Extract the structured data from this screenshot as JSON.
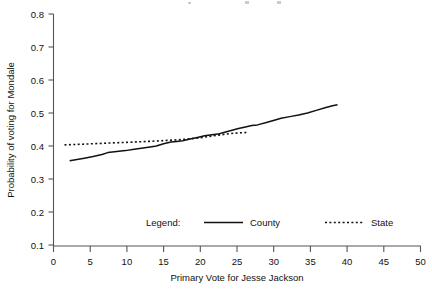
{
  "chart_data": {
    "type": "line",
    "title": "",
    "subtitle": "",
    "xlabel": "Primary Vote for Jesse Jackson",
    "ylabel": "Probability of voting for Mondale",
    "xlim": [
      0,
      50
    ],
    "ylim": [
      0.1,
      0.8
    ],
    "xticks": [
      0,
      5,
      10,
      15,
      20,
      25,
      30,
      35,
      40,
      45,
      50
    ],
    "xtick_labels": [
      "0",
      "5",
      "10",
      "15",
      "20",
      "25",
      "30",
      "35",
      "40",
      "45",
      "50"
    ],
    "yticks": [
      0.1,
      0.2,
      0.3,
      0.4,
      0.5,
      0.6,
      0.7,
      0.8
    ],
    "ytick_labels": [
      "0.1",
      "0.2",
      "0.3",
      "0.4",
      "0.5",
      "0.6",
      "0.7",
      "0.8"
    ],
    "grid": false,
    "legend_position": "inside-bottom-center",
    "legend_title": "Legend:",
    "series": [
      {
        "name": "County",
        "style": "solid",
        "color": "#111111",
        "points": [
          [
            2.2,
            0.355
          ],
          [
            3.0,
            0.358
          ],
          [
            4.2,
            0.363
          ],
          [
            5.4,
            0.368
          ],
          [
            6.6,
            0.374
          ],
          [
            7.4,
            0.38
          ],
          [
            8.6,
            0.383
          ],
          [
            9.8,
            0.386
          ],
          [
            11.0,
            0.39
          ],
          [
            12.2,
            0.394
          ],
          [
            13.4,
            0.398
          ],
          [
            14.0,
            0.4
          ],
          [
            15.0,
            0.407
          ],
          [
            16.0,
            0.412
          ],
          [
            16.8,
            0.414
          ],
          [
            17.6,
            0.416
          ],
          [
            18.6,
            0.421
          ],
          [
            19.6,
            0.426
          ],
          [
            20.6,
            0.431
          ],
          [
            21.6,
            0.434
          ],
          [
            22.4,
            0.436
          ],
          [
            23.2,
            0.441
          ],
          [
            24.2,
            0.447
          ],
          [
            25.2,
            0.453
          ],
          [
            26.0,
            0.457
          ],
          [
            27.0,
            0.462
          ],
          [
            27.8,
            0.464
          ],
          [
            29.0,
            0.471
          ],
          [
            30.2,
            0.479
          ],
          [
            31.0,
            0.484
          ],
          [
            32.2,
            0.489
          ],
          [
            33.4,
            0.494
          ],
          [
            34.6,
            0.5
          ],
          [
            35.8,
            0.508
          ],
          [
            37.0,
            0.516
          ],
          [
            38.0,
            0.522
          ],
          [
            38.7,
            0.525
          ]
        ]
      },
      {
        "name": "State",
        "style": "dotted",
        "color": "#111111",
        "points": [
          [
            1.5,
            0.4035
          ],
          [
            4.0,
            0.4055
          ],
          [
            7.0,
            0.4085
          ],
          [
            10.0,
            0.411
          ],
          [
            13.0,
            0.414
          ],
          [
            15.0,
            0.4165
          ],
          [
            17.0,
            0.419
          ],
          [
            19.0,
            0.4225
          ],
          [
            20.5,
            0.4265
          ],
          [
            21.5,
            0.43
          ],
          [
            22.5,
            0.433
          ],
          [
            23.5,
            0.436
          ],
          [
            24.5,
            0.4385
          ],
          [
            25.5,
            0.44
          ],
          [
            26.4,
            0.441
          ]
        ]
      }
    ]
  },
  "legend": {
    "label": "Legend:",
    "entries": [
      {
        "name": "County",
        "style": "solid"
      },
      {
        "name": "State",
        "style": "dotted"
      }
    ]
  },
  "axes": {
    "x_title": "Primary Vote for Jesse Jackson",
    "y_title": "Probability of voting for Mondale"
  }
}
